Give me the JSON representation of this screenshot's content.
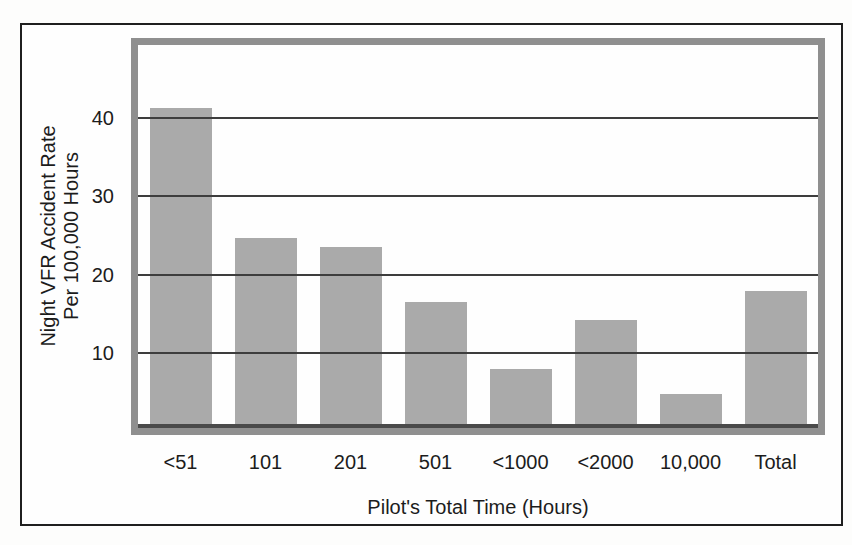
{
  "figure": {
    "background": "#fdfdfc",
    "frame_color": "#1f1f1f"
  },
  "chart_data": {
    "type": "bar",
    "title": "",
    "categories": [
      "<51",
      "101",
      "201",
      "501",
      "<1000",
      "<2000",
      "10,000",
      "Total"
    ],
    "values": [
      41.2,
      24.7,
      23.5,
      16.5,
      8.0,
      14.2,
      4.8,
      18.0
    ],
    "xlabel": "Pilot's Total Time (Hours)",
    "ylabel_line1": "Night VFR Accident Rate",
    "ylabel_line2": "Per 100,000 Hours",
    "yticks": [
      10,
      20,
      30,
      40
    ],
    "ylim": [
      0,
      49
    ],
    "grid": "horizontal-only",
    "legend": "none",
    "bar_color": "#aaaaaa",
    "plot_border_color": "#8f8f8f",
    "gridline_color": "#3d3d3d",
    "axis_line_color": "#4a4a4a",
    "text_color": "#1c1c1c"
  }
}
